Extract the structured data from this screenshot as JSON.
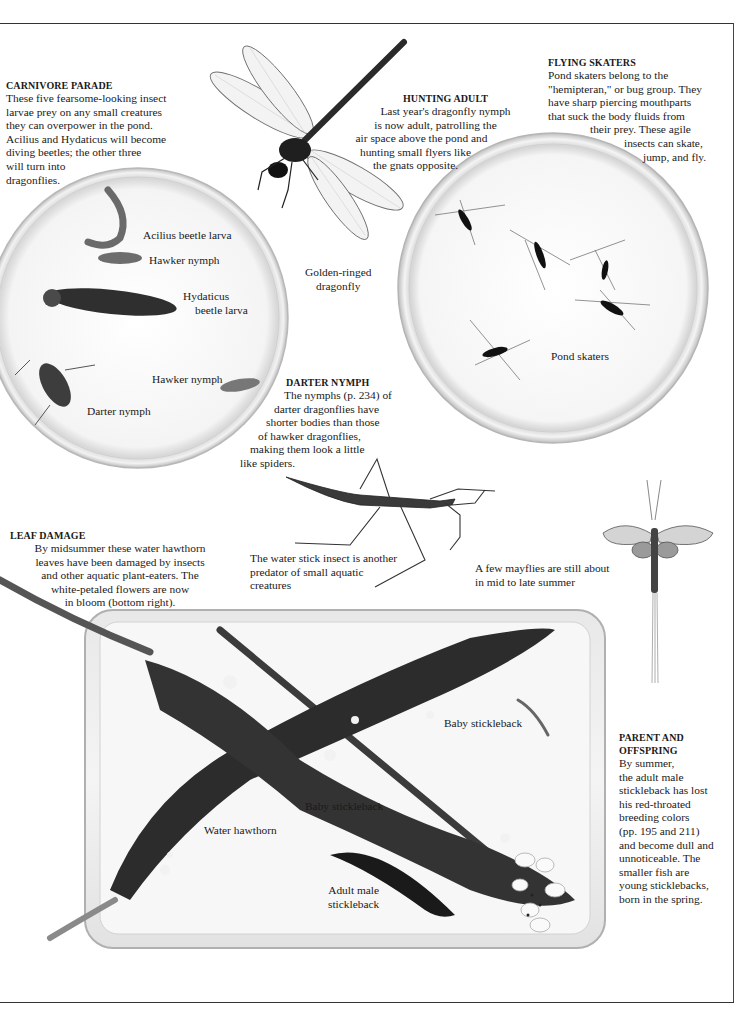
{
  "captions": {
    "carnivore_parade": {
      "heading": "CARNIVORE PARADE",
      "lines": [
        "These five fearsome-looking insect",
        "larvae prey on any small creatures",
        "they can overpower in the pond.",
        "Acilius and Hydaticus will become",
        "diving beetles; the other three",
        "will turn into",
        "dragonflies."
      ]
    },
    "hunting_adult": {
      "heading": "HUNTING ADULT",
      "lines": [
        "Last year's dragonfly nymph",
        "is now adult, patrolling the",
        "air space above the pond and",
        "hunting small flyers like",
        "the gnats opposite."
      ]
    },
    "flying_skaters": {
      "heading": "FLYING SKATERS",
      "lines": [
        "Pond skaters belong to the",
        "\"hemipteran,\" or bug group. They",
        "have sharp piercing mouthparts",
        "that suck the body fluids from",
        "their prey. These agile",
        "insects can skate,",
        "jump, and fly."
      ]
    },
    "darter_nymph": {
      "heading": "DARTER NYMPH",
      "lines": [
        "The nymphs (p. 234) of",
        "darter dragonflies have",
        "shorter bodies than those",
        "of hawker dragonflies,",
        "making them look a little",
        "like spiders."
      ]
    },
    "leaf_damage": {
      "heading": "LEAF DAMAGE",
      "lines": [
        "By midsummer these water hawthorn",
        "leaves have been damaged by insects",
        "and other aquatic plant-eaters. The",
        "white-petaled flowers are now",
        "in bloom (bottom right)."
      ]
    },
    "water_stick": {
      "lines": [
        "The water stick insect is another",
        "predator of small aquatic",
        "creatures"
      ]
    },
    "mayflies": {
      "lines": [
        "A few mayflies are still about",
        "in mid to late summer"
      ]
    },
    "parent_offspring": {
      "heading_lines": [
        "PARENT AND",
        "OFFSPRING"
      ],
      "lines": [
        "By summer,",
        "the adult male",
        "stickleback has lost",
        "his red-throated",
        "breeding colors",
        "(pp. 195 and 211)",
        "and become dull and",
        "unnoticeable. The",
        "smaller fish are",
        "young sticklebacks,",
        "born in the spring."
      ]
    }
  },
  "labels": {
    "acilius": "Acilius beetle larva",
    "hawker_1": "Hawker nymph",
    "hydaticus": [
      "Hydaticus",
      "beetle larva"
    ],
    "hawker_2": "Hawker nymph",
    "darter": "Darter nymph",
    "golden_ringed": [
      "Golden-ringed",
      "dragonfly"
    ],
    "pond_skaters": "Pond skaters",
    "baby_stickleback_1": "Baby stickleback",
    "baby_stickleback_2": "Baby stickleback",
    "water_hawthorn": "Water hawthorn",
    "adult_male": [
      "Adult male",
      "stickleback"
    ]
  }
}
